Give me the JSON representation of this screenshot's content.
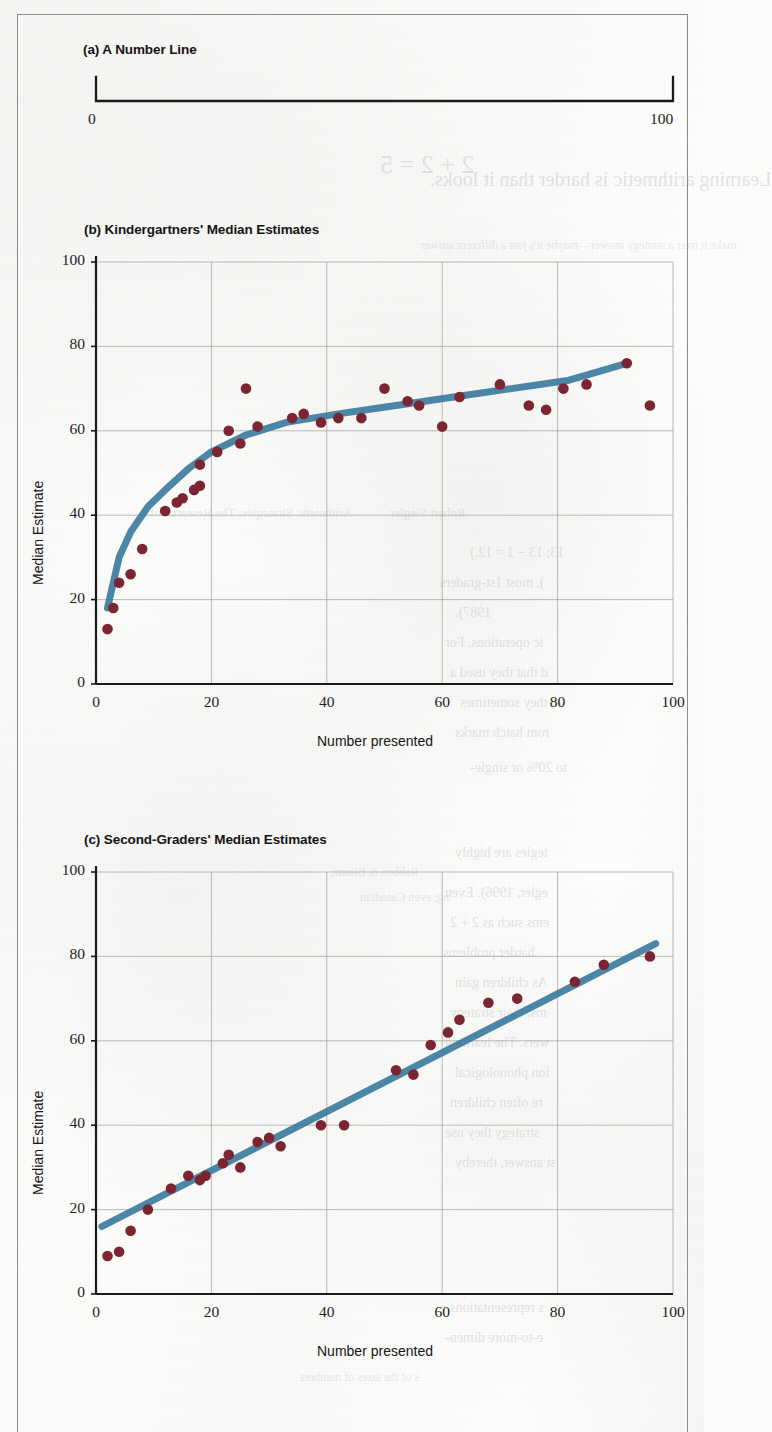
{
  "figure": {
    "panels": [
      {
        "id": "a",
        "title": "(a) A Number Line",
        "type": "numberline",
        "left_label": "0",
        "right_label": "100"
      },
      {
        "id": "b",
        "title": "(b) Kindergartners' Median Estimates",
        "type": "scatter-with-fit"
      },
      {
        "id": "c",
        "title": "(c) Second-Graders' Median Estimates",
        "type": "scatter-with-fit"
      }
    ],
    "colors": {
      "point": "#7c2532",
      "fit_line": "#3e7d9f",
      "axis": "#1a1a1a",
      "grid": "#9a9a99",
      "text": "#141414",
      "paper": "#fbfbfa",
      "frame": "#8c8c8a"
    },
    "bleed_text": [
      "2 + 2 = 5",
      "Learning arithmetic is harder than it looks.",
      "Arithmetic Strategies: The Research of",
      "Robert Siegler",
      "make it over a strategy answer—maybe it's just a different answer",
      "13; 13 − 1 = 12.)",
      "), most 1st-graders",
      "1987).",
      "ic operations. For",
      "d that they used a",
      "s; they sometimes",
      "rom hatch marks",
      "Rabbon & Bisanz,",
      "ng; even Canadian",
      "to 20% or single-",
      "tegies are highly",
      "egler, 1996). Even",
      "ems such as 2 + 2",
      "harder problems.",
      "As children gain",
      "ms, their strategy",
      "wers. The learning",
      "ion phonological",
      "re often children",
      "strategy they use",
      "st answer, thereby",
      "s representations",
      "e-to-more dimen-",
      "s of the sizes of numbers"
    ]
  },
  "chart_data": [
    {
      "type": "line",
      "id": "a",
      "title": "(a) A Number Line",
      "xlabel": "",
      "ylabel": "",
      "xlim": [
        0,
        100
      ],
      "ticks": [
        0,
        100
      ],
      "tick_labels": [
        "0",
        "100"
      ],
      "grid": false
    },
    {
      "type": "scatter",
      "id": "b",
      "title": "(b) Kindergartners' Median Estimates",
      "xlabel": "Number presented",
      "ylabel": "Median Estimate",
      "xlim": [
        0,
        100
      ],
      "ylim": [
        0,
        100
      ],
      "xticks": [
        0,
        20,
        40,
        60,
        80,
        100
      ],
      "yticks": [
        0,
        20,
        40,
        60,
        80,
        100
      ],
      "grid": true,
      "points": [
        [
          2,
          13
        ],
        [
          3,
          18
        ],
        [
          4,
          24
        ],
        [
          6,
          26
        ],
        [
          8,
          32
        ],
        [
          12,
          41
        ],
        [
          14,
          43
        ],
        [
          15,
          44
        ],
        [
          17,
          46
        ],
        [
          18,
          47
        ],
        [
          18,
          52
        ],
        [
          21,
          55
        ],
        [
          23,
          60
        ],
        [
          25,
          57
        ],
        [
          26,
          70
        ],
        [
          28,
          61
        ],
        [
          34,
          63
        ],
        [
          36,
          64
        ],
        [
          39,
          62
        ],
        [
          42,
          63
        ],
        [
          46,
          63
        ],
        [
          50,
          70
        ],
        [
          54,
          67
        ],
        [
          56,
          66
        ],
        [
          60,
          61
        ],
        [
          63,
          68
        ],
        [
          70,
          71
        ],
        [
          75,
          66
        ],
        [
          78,
          65
        ],
        [
          81,
          70
        ],
        [
          85,
          71
        ],
        [
          92,
          76
        ],
        [
          96,
          66
        ]
      ],
      "fit": {
        "name": "logarithmic fit",
        "color": "#3e7d9f",
        "x": [
          2,
          4,
          6,
          9,
          12,
          16,
          20,
          26,
          33,
          42,
          52,
          62,
          72,
          82,
          92
        ],
        "y": [
          18,
          30,
          36,
          42,
          46,
          51,
          55,
          59,
          62,
          64,
          66,
          68,
          70,
          72,
          76
        ]
      }
    },
    {
      "type": "scatter",
      "id": "c",
      "title": "(c) Second-Graders' Median Estimates",
      "xlabel": "Number presented",
      "ylabel": "Median Estimate",
      "xlim": [
        0,
        100
      ],
      "ylim": [
        0,
        100
      ],
      "xticks": [
        0,
        20,
        40,
        60,
        80,
        100
      ],
      "yticks": [
        0,
        20,
        40,
        60,
        80,
        100
      ],
      "grid": true,
      "points": [
        [
          2,
          9
        ],
        [
          4,
          10
        ],
        [
          6,
          15
        ],
        [
          9,
          20
        ],
        [
          13,
          25
        ],
        [
          16,
          28
        ],
        [
          18,
          27
        ],
        [
          19,
          28
        ],
        [
          22,
          31
        ],
        [
          23,
          33
        ],
        [
          25,
          30
        ],
        [
          28,
          36
        ],
        [
          30,
          37
        ],
        [
          32,
          35
        ],
        [
          39,
          40
        ],
        [
          43,
          40
        ],
        [
          52,
          53
        ],
        [
          55,
          52
        ],
        [
          58,
          59
        ],
        [
          61,
          62
        ],
        [
          63,
          65
        ],
        [
          68,
          69
        ],
        [
          73,
          70
        ],
        [
          83,
          74
        ],
        [
          88,
          78
        ],
        [
          96,
          80
        ]
      ],
      "fit": {
        "name": "linear fit",
        "color": "#3e7d9f",
        "x": [
          1,
          97
        ],
        "y": [
          16,
          83
        ]
      }
    }
  ]
}
